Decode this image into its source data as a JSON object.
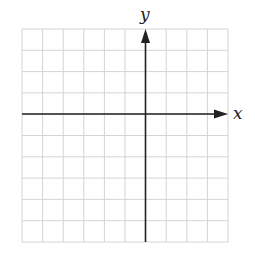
{
  "diagram": {
    "type": "cartesian-grid",
    "x_axis_label": "x",
    "y_axis_label": "y",
    "grid": {
      "columns": 10,
      "rows": 10,
      "x_range": [
        -6,
        4
      ],
      "y_range": [
        -6,
        4
      ],
      "origin_col": 6,
      "origin_row": 4
    },
    "colors": {
      "grid_line": "#d4d4d4",
      "axis": "#222222",
      "background": "#ffffff"
    }
  }
}
